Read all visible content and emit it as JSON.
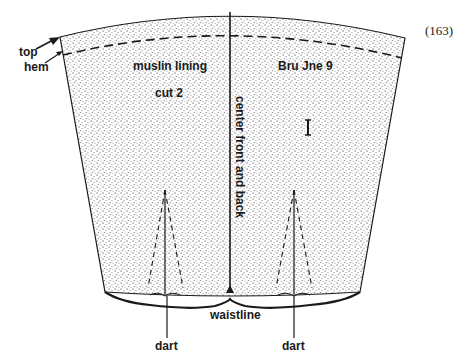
{
  "figure": {
    "number": "(163)",
    "labels": {
      "top": "top",
      "hem": "hem",
      "muslin_lining": "muslin lining",
      "cut": "cut 2",
      "code": "Bru Jne 9",
      "center": "center front and back",
      "waistline": "waistline",
      "dart_left": "dart",
      "dart_right": "dart"
    },
    "colors": {
      "ink": "#1a1a1a",
      "paper": "#ffffff",
      "stipple": "#555555"
    }
  }
}
